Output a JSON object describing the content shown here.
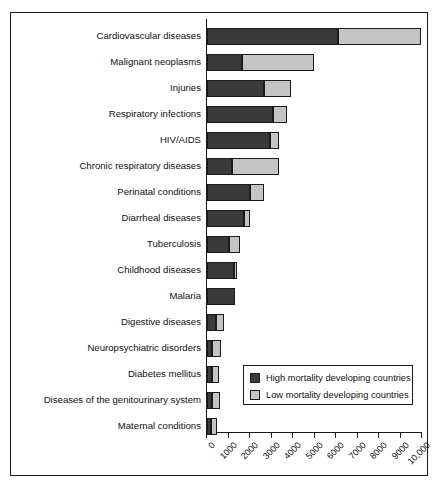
{
  "chart_data": {
    "type": "bar",
    "orientation": "horizontal",
    "stacked": true,
    "title": "",
    "xlabel": "",
    "ylabel": "",
    "xlim": [
      0,
      10000
    ],
    "xticks": [
      0,
      1000,
      2000,
      3000,
      4000,
      5000,
      6000,
      7000,
      8000,
      9000,
      10000
    ],
    "xtick_labels": [
      "0",
      "1000",
      "2000",
      "3000",
      "4000",
      "5000",
      "6000",
      "7000",
      "8000",
      "9000",
      "10,000"
    ],
    "grid": false,
    "legend_position": "lower-right",
    "categories": [
      "Cardiovascular diseases",
      "Malignant neoplasms",
      "Injuries",
      "Respiratory infections",
      "HIV/AIDS",
      "Chronic respiratory diseases",
      "Perinatal conditions",
      "Diarrheal diseases",
      "Tuberculosis",
      "Childhood diseases",
      "Malaria",
      "Digestive diseases",
      "Neuropsychiatric disorders",
      "Diabetes mellitus",
      "Diseases of the genitourinary system",
      "Maternal conditions"
    ],
    "series": [
      {
        "name": "High mortality developing countries",
        "color": "#3a3a3a",
        "values": [
          6100,
          1650,
          2650,
          3070,
          2950,
          1150,
          2000,
          1720,
          1000,
          1250,
          1300,
          420,
          250,
          230,
          250,
          200
        ]
      },
      {
        "name": "Low mortality developing countries",
        "color": "#c4c4c4",
        "values": [
          3850,
          3350,
          1250,
          630,
          400,
          2200,
          650,
          280,
          550,
          150,
          0,
          380,
          380,
          330,
          350,
          250
        ]
      }
    ],
    "totals": [
      9950,
      5000,
      3900,
      3700,
      3350,
      3350,
      2650,
      2000,
      1550,
      1400,
      1300,
      800,
      630,
      560,
      600,
      450
    ]
  },
  "legend": {
    "items": [
      {
        "label": "High mortality developing countries",
        "color": "#3a3a3a"
      },
      {
        "label": "Low mortality developing countries",
        "color": "#c4c4c4"
      }
    ]
  }
}
